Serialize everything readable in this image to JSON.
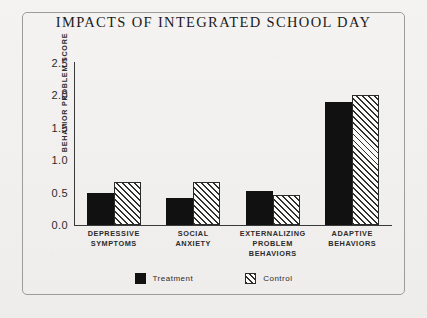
{
  "chart_data": {
    "type": "bar",
    "title": "IMPACTS OF INTEGRATED SCHOOL DAY",
    "xlabel": "",
    "ylabel": "BEHAVIOR PROBLEM SCORE",
    "ylim": [
      0.0,
      2.5
    ],
    "ytick_labels": [
      "2.5",
      "2.0",
      "1.5",
      "1.0",
      "0.5",
      "0.0"
    ],
    "ytick_values": [
      2.5,
      2.0,
      1.5,
      1.0,
      0.5,
      0.0
    ],
    "grid": false,
    "legend_position": "bottom-center",
    "categories": [
      "DEPRESSIVE SYMPTOMS",
      "SOCIAL ANXIETY",
      "EXTERNALIZING PROBLEM BEHAVIORS",
      "ADAPTIVE BEHAVIORS"
    ],
    "category_lines": [
      [
        "DEPRESSIVE",
        "SYMPTOMS"
      ],
      [
        "SOCIAL",
        "ANXIETY"
      ],
      [
        "EXTERNALIZING",
        "PROBLEM",
        "BEHAVIORS"
      ],
      [
        "ADAPTIVE",
        "BEHAVIORS"
      ]
    ],
    "series": [
      {
        "name": "Treatment",
        "values": [
          0.5,
          0.42,
          0.52,
          1.9
        ],
        "color": "#111111",
        "pattern": "solid"
      },
      {
        "name": "Control",
        "values": [
          0.67,
          0.67,
          0.47,
          2.0
        ],
        "color": "#fbfbfa",
        "pattern": "diagonal-hatch"
      }
    ]
  },
  "legend": {
    "items": [
      {
        "label": "Treatment",
        "pattern": "solid"
      },
      {
        "label": "Control",
        "pattern": "diagonal-hatch"
      }
    ]
  },
  "colors": {
    "background": "#f2f2f0",
    "border": "#9c9c9c",
    "axis": "#3a3a3a",
    "text": "#1b1b1b",
    "treatment": "#111111",
    "control_fill": "#fbfbfa",
    "control_hatch": "#2f2f2f"
  }
}
